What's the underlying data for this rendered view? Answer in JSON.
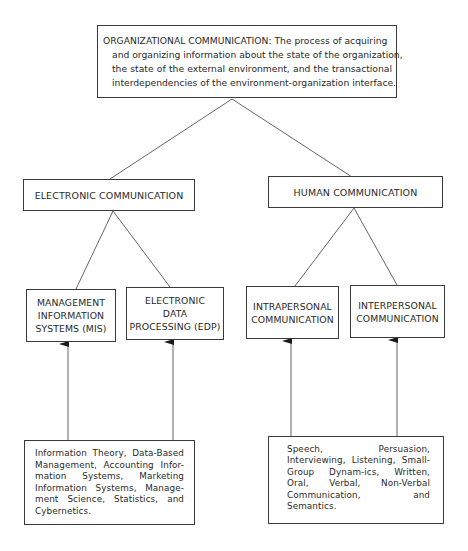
{
  "diagram": {
    "root": {
      "title": "ORGANIZATIONAL COMMUNICATION:",
      "line1": "ORGANIZATIONAL COMMUNICATION: The process of acquiring",
      "line2": "and organizing information about the state of the organization,",
      "line3": "the state of the external environment, and the transactional",
      "line4": "interdependencies of the environment-organization interface."
    },
    "level2": [
      {
        "label": "ELECTRONIC COMMUNICATION"
      },
      {
        "label": "HUMAN COMMUNICATION"
      }
    ],
    "level3": [
      {
        "label": "MANAGEMENT INFORMATION SYSTEMS (MIS)",
        "lines": [
          "MANAGEMENT",
          "INFORMATION",
          "SYSTEMS (MIS)"
        ],
        "parent": "ELECTRONIC COMMUNICATION"
      },
      {
        "label": "ELECTRONIC DATA PROCESSING (EDP)",
        "lines": [
          "ELECTRONIC",
          "DATA",
          "PROCESSING (EDP)"
        ],
        "parent": "ELECTRONIC COMMUNICATION"
      },
      {
        "label": "INTRAPERSONAL COMMUNICATION",
        "lines": [
          "INTRAPERSONAL",
          "COMMUNICATION"
        ],
        "parent": "HUMAN COMMUNICATION"
      },
      {
        "label": "INTERPERSONAL COMMUNICATION",
        "lines": [
          "INTERPERSONAL",
          "COMMUNICATION"
        ],
        "parent": "HUMAN COMMUNICATION"
      }
    ],
    "foundations": [
      {
        "text": "Information Theory, Data-Based Management, Accounting Infor-mation Systems, Marketing Information Systems, Manage-ment Science, Statistics, and Cybernetics.",
        "feeds": [
          "MANAGEMENT INFORMATION SYSTEMS (MIS)",
          "ELECTRONIC DATA PROCESSING (EDP)"
        ]
      },
      {
        "text": "Speech, Persuasion, Interviewing, Listening, Small-Group Dynam-ics, Written, Oral, Verbal, Non-Verbal Communication, and Semantics.",
        "feeds": [
          "INTRAPERSONAL COMMUNICATION",
          "INTERPERSONAL COMMUNICATION"
        ]
      }
    ],
    "colors": {
      "line": "#555555",
      "border": "#3a3a3a",
      "text": "#2a2a2a",
      "background": "#ffffff"
    }
  }
}
